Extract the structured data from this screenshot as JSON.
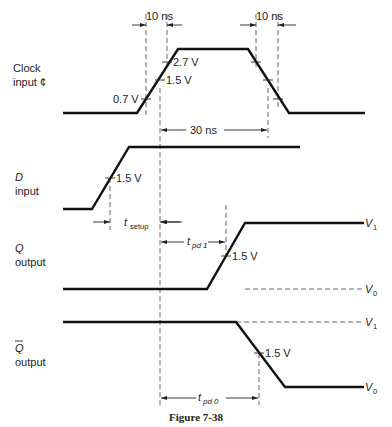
{
  "figure": {
    "caption": "Figure 7-38",
    "signals": {
      "clock": {
        "name": "Clock",
        "name2": "input ¢"
      },
      "d": {
        "name": "D",
        "name2": "input"
      },
      "q": {
        "name": "Q",
        "name2": "output"
      },
      "qbar": {
        "name": "Q",
        "name2": "output"
      }
    },
    "annotations": {
      "rise_time": "10 ns",
      "fall_time": "10 ns",
      "pulse_width": "30 ns",
      "clock_v_low": "0.7 V",
      "clock_v_mid": "1.5 V",
      "clock_v_high": "2.7 V",
      "d_threshold": "1.5 V",
      "q_threshold": "1.5 V",
      "qbar_threshold": "1.5 V",
      "t_setup_main": "t",
      "t_setup_sub": "setup",
      "t_pd1_main": "t",
      "t_pd1_sub": "pd 1",
      "t_pd0_main": "t",
      "t_pd0_sub": "pd 0",
      "q_v1": "V",
      "q_v1_sub": "1",
      "q_v0": "V",
      "q_v0_sub": "0",
      "qbar_v1": "V",
      "qbar_v1_sub": "1",
      "qbar_v0": "V",
      "qbar_v0_sub": "0"
    }
  }
}
